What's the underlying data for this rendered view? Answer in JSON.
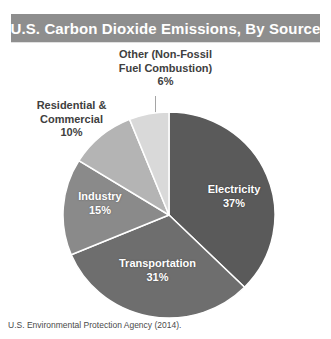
{
  "title": "U.S. Carbon Dioxide Emissions, By Source",
  "source_note": "U.S. Environmental Protection Agency (2014).",
  "callouts": {
    "other": {
      "line1": "Other (Non-Fossil",
      "line2": "Fuel Combustion)",
      "line3": "6%"
    },
    "residential": {
      "line1": "Residential &",
      "line2": "Commercial",
      "line3": "10%"
    }
  },
  "slice_labels": {
    "electricity": {
      "name": "Electricity",
      "percent": "37%"
    },
    "industry": {
      "name": "Industry",
      "percent": "15%"
    },
    "transportation": {
      "name": "Transportation",
      "percent": "31%"
    }
  },
  "colors": {
    "banner": "#8e8e8e",
    "banner_text": "#ffffff",
    "electricity": "#5a5a5a",
    "transportation": "#6e6e6e",
    "industry": "#8a8a8a",
    "residential": "#b4b4b4",
    "other": "#d9d9d9",
    "slice_divider": "#ffffff",
    "text": "#404040"
  },
  "chart_data": {
    "type": "pie",
    "title": "U.S. Carbon Dioxide Emissions, By Source",
    "subtitle": "",
    "xlabel": "",
    "ylabel": "",
    "units": "percent of total U.S. CO2 emissions",
    "start_angle_deg": 0,
    "direction": "clockwise",
    "legend": "none (labels on/near slices)",
    "grid": false,
    "categories": [
      "Electricity",
      "Transportation",
      "Industry",
      "Residential & Commercial",
      "Other (Non-Fossil Fuel Combustion)"
    ],
    "values": [
      37,
      31,
      15,
      10,
      6
    ],
    "labels": [
      "37%",
      "31%",
      "15%",
      "10%",
      "6%"
    ],
    "slices": [
      {
        "label": "Electricity",
        "value": 37,
        "display": "37%",
        "color": "#5a5a5a",
        "label_position": "inside",
        "text_color": "#ffffff"
      },
      {
        "label": "Transportation",
        "value": 31,
        "display": "31%",
        "color": "#6e6e6e",
        "label_position": "inside",
        "text_color": "#ffffff"
      },
      {
        "label": "Industry",
        "value": 15,
        "display": "15%",
        "color": "#8a8a8a",
        "label_position": "inside",
        "text_color": "#ffffff"
      },
      {
        "label": "Residential & Commercial",
        "value": 10,
        "display": "10%",
        "color": "#b4b4b4",
        "label_position": "outside-left",
        "text_color": "#404040"
      },
      {
        "label": "Other (Non-Fossil Fuel Combustion)",
        "value": 6,
        "display": "6%",
        "color": "#d9d9d9",
        "label_position": "outside-top",
        "text_color": "#404040"
      }
    ],
    "total": 99,
    "annotations": [
      "U.S. Environmental Protection Agency (2014)."
    ]
  }
}
